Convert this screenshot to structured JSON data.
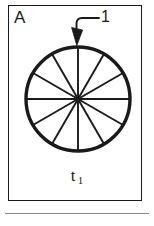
{
  "figure": {
    "panel_letter": "A",
    "callout_number": "1",
    "time_label": {
      "base": "t",
      "subscript": "1"
    }
  },
  "diagram": {
    "type": "sector-divided-circle",
    "circle": {
      "center_x": 78,
      "center_y": 99,
      "radius": 52,
      "stroke_width": 3.2,
      "fill": "#ffffff",
      "stroke": "#1a1a1a"
    },
    "sectors": {
      "count": 12,
      "angle_step_degrees": 30,
      "spoke_stroke_width": 1.9,
      "spoke_stroke": "#1a1a1a",
      "spoke_angles_degrees": [
        0,
        30,
        60,
        90,
        120,
        150,
        180,
        210,
        240,
        270,
        300,
        330
      ]
    },
    "arrow": {
      "label": "1",
      "target_x": 78,
      "target_y": 45,
      "leader_start_x": 99,
      "leader_start_y": 18,
      "head_width": 8,
      "head_length": 13,
      "stroke": "#1a1a1a",
      "stroke_width": 1.8
    }
  },
  "colors": {
    "ink": "#1a1a1a",
    "rule": "#8a8a8a",
    "paper": "#ffffff"
  }
}
